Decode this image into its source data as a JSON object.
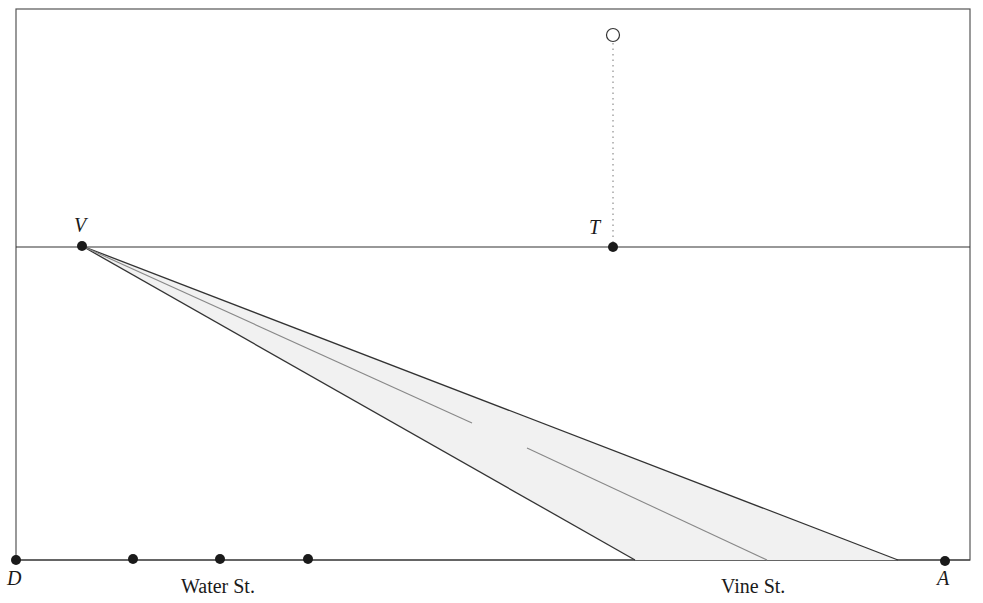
{
  "diagram": {
    "title": "",
    "points": {
      "V": {
        "label": "V",
        "x": 82,
        "y": 246
      },
      "T": {
        "label": "T",
        "x": 613,
        "y": 247
      },
      "D": {
        "label": "D",
        "x": 16,
        "y": 560
      },
      "A": {
        "label": "A",
        "x": 945,
        "y": 561
      }
    },
    "open_point": {
      "x": 613,
      "y": 35
    },
    "bottom_dots": [
      {
        "x": 133,
        "y": 559
      },
      {
        "x": 220,
        "y": 559
      },
      {
        "x": 308,
        "y": 559
      }
    ],
    "street_labels": {
      "water": "Water St.",
      "vine": "Vine St."
    },
    "road": {
      "left_edge_bottom_x": 635,
      "right_edge_bottom_x": 898,
      "center_bottom_x": 767,
      "center_gap": [
        472,
        527
      ],
      "fill": "#f1f1f1"
    },
    "colors": {
      "line": "#333333",
      "center": "#888888",
      "frame": "#555555",
      "dot": "#1a1a1a"
    }
  }
}
